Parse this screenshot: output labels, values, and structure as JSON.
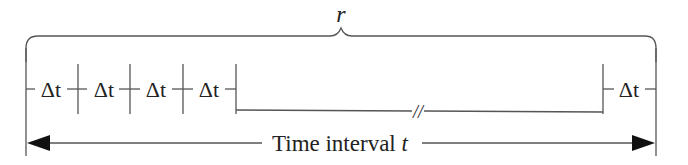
{
  "diagram": {
    "brace_label": "r",
    "interval_labels": [
      "Δt",
      "Δt",
      "Δt",
      "Δt"
    ],
    "last_interval_label": "Δt",
    "gap_marker": "//",
    "axis": {
      "label_text": "Time interval ",
      "label_var": "t"
    },
    "colors": {
      "stroke": "#444444",
      "text": "#222222",
      "background": "#ffffff"
    }
  }
}
